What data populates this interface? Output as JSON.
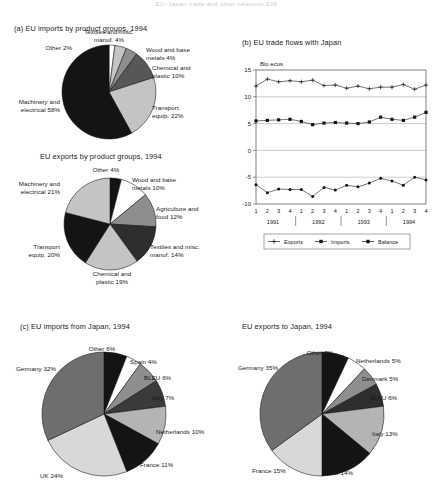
{
  "header": {
    "running_head": "EU–Japan trade and other relations    229"
  },
  "panels": {
    "a": {
      "title": "(a) EU imports by product groups, 1994",
      "subtitle": "EU exports by product groups, 1994"
    },
    "b": {
      "title": "(b) EU trade flows with Japan"
    },
    "c": {
      "title": "(c) EU imports from Japan, 1994",
      "title2": "EU exports to Japan, 1994"
    }
  },
  "chart_data": [
    {
      "type": "pie",
      "title": "(a) EU imports by product groups, 1994",
      "categories": [
        "Other",
        "Textiles and misc. manuf.",
        "Wood and base metals",
        "Chemical and plastic",
        "Transport equip.",
        "Machinery and electrical"
      ],
      "values": [
        2,
        4,
        4,
        10,
        22,
        58
      ],
      "labels": [
        "Other 2%",
        "Textiles and misc. manuf. 4%",
        "Wood and base metals 4%",
        "Chemical and plastic 10%",
        "Transport equip. 22%",
        "Machinery and electrical 58%"
      ],
      "colors": [
        "#ffffff",
        "#c4c4c4",
        "#8e8e8e",
        "#575757",
        "#c4c4c4",
        "#141414"
      ],
      "unit": "%"
    },
    {
      "type": "pie",
      "title": "EU exports by product groups, 1994",
      "categories": [
        "Other",
        "Wood and base metals",
        "Agriculture and food",
        "Textiles and misc. manuf.",
        "Chemical and plastic",
        "Transport equip.",
        "Machinery and electrical"
      ],
      "values": [
        4,
        10,
        12,
        14,
        19,
        20,
        21
      ],
      "labels": [
        "Other 4%",
        "Wood and base metals 10%",
        "Agriculture and food 12%",
        "Textiles and misc. manuf. 14%",
        "Chemical and plastic 19%",
        "Transport equip. 20%",
        "Machinery and electrical 21%"
      ],
      "colors": [
        "#141414",
        "#ffffff",
        "#8e8e8e",
        "#2e2e2e",
        "#c4c4c4",
        "#141414",
        "#c4c4c4"
      ],
      "unit": "%"
    },
    {
      "type": "line",
      "title": "(b) EU trade flows with Japan",
      "ylabel": "Bio ecus",
      "xlabel": "",
      "ylim": [
        -10,
        15
      ],
      "yticks": [
        -10,
        -5,
        0,
        5,
        10,
        15
      ],
      "grid": true,
      "legend_position": "bottom",
      "quarters": [
        "1",
        "2",
        "3",
        "4",
        "1",
        "2",
        "3",
        "4",
        "1",
        "2",
        "3",
        "4",
        "1",
        "2",
        "3",
        "4"
      ],
      "years": [
        "1991",
        "1992",
        "1993",
        "1994"
      ],
      "series": [
        {
          "name": "Exports",
          "marker": "plus",
          "values": [
            12.0,
            13.3,
            12.8,
            13.0,
            12.8,
            13.1,
            12.1,
            12.2,
            11.6,
            12.0,
            11.5,
            11.8,
            11.8,
            12.3,
            11.4,
            12.2
          ]
        },
        {
          "name": "Imports",
          "marker": "square",
          "values": [
            5.5,
            5.6,
            5.7,
            5.8,
            5.4,
            4.8,
            5.1,
            5.2,
            5.1,
            5.0,
            5.3,
            6.2,
            5.8,
            5.6,
            6.2,
            7.1
          ]
        },
        {
          "name": "Balance",
          "marker": "diamond",
          "values": [
            -6.4,
            -7.9,
            -7.2,
            -7.3,
            -7.3,
            -8.6,
            -6.9,
            -7.4,
            -6.5,
            -6.8,
            -6.1,
            -5.2,
            -5.7,
            -6.5,
            -5.0,
            -5.5
          ]
        }
      ]
    },
    {
      "type": "pie",
      "title": "(c) EU imports from Japan, 1994",
      "categories": [
        "Other",
        "Spain",
        "BLEU",
        "Italy",
        "Netherlands",
        "France",
        "UK",
        "Germany"
      ],
      "values": [
        6,
        4,
        6,
        7,
        10,
        11,
        24,
        32
      ],
      "labels": [
        "Other 6%",
        "Spain 4%",
        "BLEU 6%",
        "Italy 7%",
        "Netherlands 10%",
        "France 11%",
        "UK 24%",
        "Germany 32%"
      ],
      "colors": [
        "#141414",
        "#ffffff",
        "#8e8e8e",
        "#3a3a3a",
        "#b4b4b4",
        "#141414",
        "#d8d8d8",
        "#6e6e6e"
      ],
      "unit": "%"
    },
    {
      "type": "pie",
      "title": "EU exports to Japan, 1994",
      "categories": [
        "Other",
        "Netherlands",
        "Denmark",
        "BLEU",
        "Italy",
        "UK",
        "France",
        "Germany"
      ],
      "values": [
        7,
        5,
        5,
        6,
        13,
        14,
        15,
        35
      ],
      "labels": [
        "Other 7%",
        "Netherlands 5%",
        "Denmark 5%",
        "BLEU 6%",
        "Italy 13%",
        "UK 14%",
        "France 15%",
        "Germany 35%"
      ],
      "colors": [
        "#141414",
        "#ffffff",
        "#8e8e8e",
        "#2e2e2e",
        "#b4b4b4",
        "#141414",
        "#d8d8d8",
        "#6e6e6e"
      ],
      "unit": "%"
    }
  ],
  "legend": {
    "items": [
      "Exports",
      "Imports",
      "Balance"
    ]
  },
  "axis_b": {
    "ylabel": "Bio ecus",
    "yticks": [
      "15",
      "10",
      "5",
      "0",
      "-5",
      "-10"
    ],
    "quarters": [
      "1",
      "2",
      "3",
      "4",
      "1",
      "2",
      "3",
      "4",
      "1",
      "2",
      "3",
      "4",
      "1",
      "2",
      "3",
      "4"
    ],
    "years": [
      "1991",
      "1992",
      "1993",
      "1994"
    ]
  },
  "labels_a1": {
    "other": "Other 2%",
    "textiles": "Textiles and misc.\nmanuf. 4%",
    "wood": "Wood and base\nmetals 4%",
    "chemical": "Chemical and\nplastic 10%",
    "transport": "Transport\nequip. 22%",
    "machinery": "Machinery and\nelectrical 58%"
  },
  "labels_a2": {
    "other": "Other 4%",
    "wood": "Wood and base\nmetals 10%",
    "agriculture": "Agriculture and\nfood 12%",
    "textiles": "Textiles and misc.\nmanuf. 14%",
    "chemical": "Chemical and\nplastic 19%",
    "transport": "Transport\nequip. 20%",
    "machinery": "Machinery and\nelectrical 21%"
  },
  "labels_c": {
    "other": "Other 6%",
    "spain": "Spain 4%",
    "bleu": "BLEU 6%",
    "italy": "Italy 7%",
    "netherlands": "Netherlands 10%",
    "france": "France 11%",
    "uk": "UK 24%",
    "germany": "Germany 32%"
  },
  "labels_d": {
    "other": "Other 7%",
    "netherlands": "Netherlands 5%",
    "denmark": "Denmark 5%",
    "bleu": "BLEU 6%",
    "italy": "Italy 13%",
    "uk": "UK 14%",
    "france": "France 15%",
    "germany": "Germany 35%"
  }
}
